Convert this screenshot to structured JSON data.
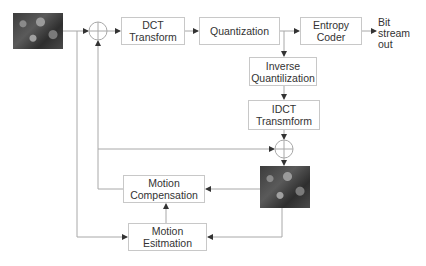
{
  "diagram": {
    "type": "video encoder block diagram",
    "blocks": {
      "dct": "DCT\nTransform",
      "quant": "Quantization",
      "entropy": "Entropy\nCoder",
      "iquant": "Inverse\nQuantilization",
      "idct": "IDCT\nTransmform",
      "mc": "Motion\nCompensation",
      "me": "Motion\nEsitmation"
    },
    "output_label": "Bit\nstream\nout",
    "images": [
      "input-frame",
      "reconstructed-frame"
    ],
    "summing_junctions": 2,
    "colors": {
      "line": "#a0a0a0",
      "box_border": "#c8c8c8",
      "text": "#333333"
    }
  }
}
